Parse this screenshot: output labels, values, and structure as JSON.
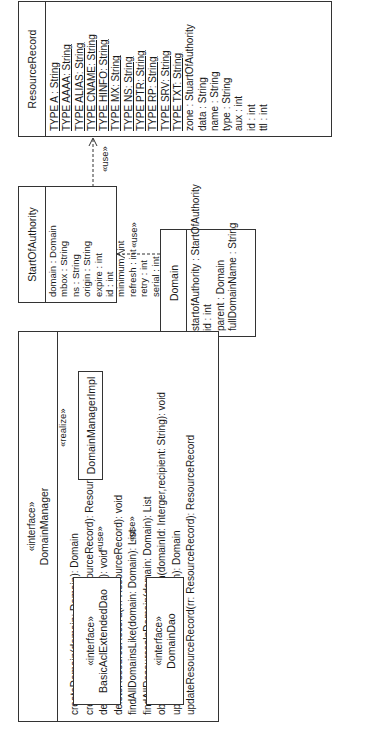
{
  "diagram": {
    "type": "UML class diagram",
    "orientation": "rotated 90 degrees",
    "classes": {
      "resource_record": {
        "name": "ResourceRecord",
        "static_attributes": [
          "TYPE A : String",
          "TYPE AAAA: String",
          "TYPE ALIAS: String",
          "TYPE CNAME: String",
          "TYPE HINFO: String",
          "TYPE MX: String",
          "TYPE NS: String",
          "TYPE PTR: String",
          "TYPE RP: String",
          "TYPE SRV: String",
          "TYPE TXT: String"
        ],
        "attributes": [
          "zone : StuartOfAuthority",
          "data : String",
          "name : String",
          "type : String",
          "aux : int",
          "id : int",
          "ttl : int"
        ]
      },
      "start_of_authority": {
        "name": "StartOfAuthority",
        "attributes": [
          "domain : Domain",
          "mbox : String",
          "ns : String",
          "origin : String",
          "expire : int",
          "id : int",
          "minimum : int",
          "refresh : int",
          "retry : int",
          "serial : int",
          "ttl : int"
        ]
      },
      "domain": {
        "name": "Domain",
        "attributes": [
          "startofAuthority : StartOfAuthority",
          "id : int",
          "parent : Domain",
          "fullDomainName : String"
        ]
      },
      "domain_manager": {
        "stereotype": "«interface»",
        "name": "DomainManager",
        "operations": [
          "createDomain(domain: Domain): Domain",
          "createResourceRecord(rr: ResourceRecord): ResourceRecord",
          "deleteDomain(domain: Domain): void",
          "deleteResourceRecord(rr: ResourceRecord): void",
          "findAllDomainsLike(domain: Domain): List",
          "findAllResourcesInDomain(domain: Domain): List",
          "obtainAdministrativePermission(domainId: Interger,recipient: String): void",
          "updateDomain(domain: Domain): Domain",
          "updateResourceRecord(rr: ResourceRecord): ResourceRecord"
        ]
      },
      "domain_manager_impl": {
        "name": "DomainManagerImpl"
      },
      "basic_acl_extended_dao": {
        "stereotype": "«interface»",
        "name": "BasicAclExtendedDao"
      },
      "domain_dao": {
        "stereotype": "«interface»",
        "name": "DomainDao"
      }
    },
    "relations": {
      "soa_uses_rr": "«use»",
      "domain_uses_soa": "«use»",
      "impl_realizes_manager": "«realize»",
      "impl_uses_acl": "«use»",
      "impl_uses_dao": "«use»"
    },
    "colors": {
      "line": "#333333",
      "background": "#ffffff",
      "text": "#1a1a1a"
    }
  }
}
